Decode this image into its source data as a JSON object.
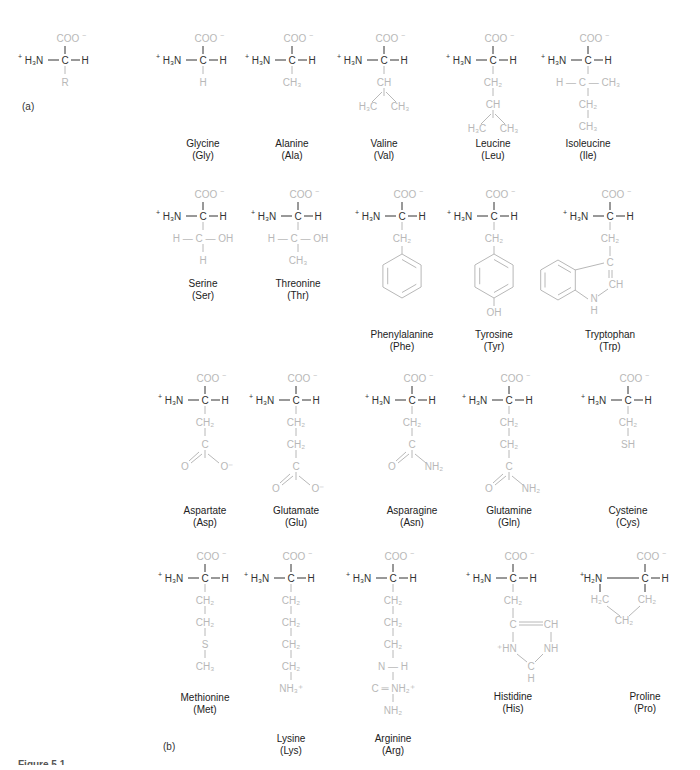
{
  "figure": {
    "panel_a_label": "(a)",
    "panel_b_label": "(b)",
    "caption": "Figure 5.1",
    "colors": {
      "backbone": "#333333",
      "side_chain": "#b8b8b8",
      "label": "#222222"
    }
  },
  "general_structure": {
    "x": 65,
    "y": 60,
    "alpha_group": "COO⁻",
    "amine": "⁺H₃N",
    "side_chain": [
      "R"
    ]
  },
  "amino_acids": [
    {
      "name": "Glycine",
      "abbr": "(Gly)",
      "x": 203,
      "y": 60,
      "side_chain": [
        "H"
      ],
      "label_y": 138
    },
    {
      "name": "Alanine",
      "abbr": "(Ala)",
      "x": 292,
      "y": 60,
      "side_chain": [
        "CH₃"
      ],
      "label_y": 138
    },
    {
      "name": "Valine",
      "abbr": "(Val)",
      "x": 384,
      "y": 60,
      "side_chain": [
        "CH",
        "H₃C   CH₃"
      ],
      "label_y": 138
    },
    {
      "name": "Leucine",
      "abbr": "(Leu)",
      "x": 493,
      "y": 60,
      "side_chain": [
        "CH₂",
        "CH",
        "H₃C   CH₃"
      ],
      "label_y": 138
    },
    {
      "name": "Isoleucine",
      "abbr": "(Ile)",
      "x": 588,
      "y": 60,
      "side_chain": [
        "H — C — CH₃",
        "CH₂",
        "CH₃"
      ],
      "label_y": 138
    },
    {
      "name": "Serine",
      "abbr": "(Ser)",
      "x": 203,
      "y": 216,
      "side_chain": [
        "H — C — OH",
        "H"
      ],
      "label_y": 278
    },
    {
      "name": "Threonine",
      "abbr": "(Thr)",
      "x": 298,
      "y": 216,
      "side_chain": [
        "H — C — OH",
        "CH₃"
      ],
      "label_y": 278
    },
    {
      "name": "Phenylalanine",
      "abbr": "(Phe)",
      "x": 402,
      "y": 216,
      "side_chain": [
        "CH₂",
        "benzene"
      ],
      "label_y": 329
    },
    {
      "name": "Tyrosine",
      "abbr": "(Tyr)",
      "x": 494,
      "y": 216,
      "side_chain": [
        "CH₂",
        "benzene",
        "OH"
      ],
      "label_y": 329
    },
    {
      "name": "Tryptophan",
      "abbr": "(Trp)",
      "x": 610,
      "y": 216,
      "side_chain": [
        "CH₂",
        "indole",
        "N",
        "H"
      ],
      "label_y": 329
    },
    {
      "name": "Aspartate",
      "abbr": "(Asp)",
      "x": 205,
      "y": 400,
      "side_chain": [
        "CH₂",
        "C",
        "O   O⁻"
      ],
      "label_y": 505
    },
    {
      "name": "Glutamate",
      "abbr": "(Glu)",
      "x": 296,
      "y": 400,
      "side_chain": [
        "CH₂",
        "CH₂",
        "C",
        "O   O⁻"
      ],
      "label_y": 505
    },
    {
      "name": "Asparagine",
      "abbr": "(Asn)",
      "x": 412,
      "y": 400,
      "side_chain": [
        "CH₂",
        "C",
        "O   NH₂"
      ],
      "label_y": 505
    },
    {
      "name": "Glutamine",
      "abbr": "(Gln)",
      "x": 509,
      "y": 400,
      "side_chain": [
        "CH₂",
        "CH₂",
        "C",
        "O   NH₂"
      ],
      "label_y": 505
    },
    {
      "name": "Cysteine",
      "abbr": "(Cys)",
      "x": 628,
      "y": 400,
      "side_chain": [
        "CH₂",
        "SH"
      ],
      "label_y": 505
    },
    {
      "name": "Methionine",
      "abbr": "(Met)",
      "x": 205,
      "y": 578,
      "side_chain": [
        "CH₂",
        "CH₂",
        "S",
        "CH₃"
      ],
      "label_y": 692
    },
    {
      "name": "Lysine",
      "abbr": "(Lys)",
      "x": 291,
      "y": 578,
      "side_chain": [
        "CH₂",
        "CH₂",
        "CH₂",
        "CH₂",
        "NH₃⁺"
      ],
      "label_y": 733
    },
    {
      "name": "Arginine",
      "abbr": "(Arg)",
      "x": 393,
      "y": 578,
      "side_chain": [
        "CH₂",
        "CH₂",
        "CH₂",
        "N — H",
        "C ═ NH₂⁺",
        "NH₂"
      ],
      "label_y": 733
    },
    {
      "name": "Histidine",
      "abbr": "(His)",
      "x": 513,
      "y": 578,
      "side_chain": [
        "CH₂",
        "imidazole"
      ],
      "label_y": 691
    },
    {
      "name": "Proline",
      "abbr": "(Pro)",
      "x": 645,
      "y": 578,
      "side_chain": [
        "pyrrolidine"
      ],
      "label_y": 691
    }
  ]
}
